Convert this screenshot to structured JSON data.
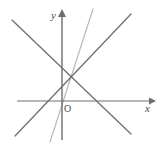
{
  "figure": {
    "background_color": "#ffffff",
    "width": 160,
    "height": 148
  },
  "axes": {
    "x_axis": {
      "name": "x-axis",
      "label": "x",
      "label_x": 145,
      "label_y": 112,
      "color": "#6e6e6e",
      "stroke_width": 1.2,
      "x1": 17,
      "y1": 101,
      "x2": 150,
      "y2": 101,
      "arrow": "right"
    },
    "y_axis": {
      "name": "y-axis",
      "label": "y",
      "label_x": 51,
      "label_y": 19,
      "color": "#6e6e6e",
      "stroke_width": 1.4,
      "x1": 62,
      "y1": 140,
      "x2": 62,
      "y2": 16,
      "arrow": "up"
    },
    "origin": {
      "label": "O",
      "label_x": 64,
      "label_y": 112,
      "point_x": 62,
      "point_y": 101
    }
  },
  "lines": [
    {
      "name": "descending-line",
      "description": "line falling from upper-left to lower-right",
      "color": "#6f6f6f",
      "stroke_width": 1.3,
      "x1": 12,
      "y1": 20,
      "x2": 131,
      "y2": 134,
      "x_intercept_px": 86,
      "y_intercept_px": 70
    },
    {
      "name": "ascending-line",
      "description": "line rising from lower-left to upper-right",
      "color": "#6f6f6f",
      "stroke_width": 1.3,
      "x1": 15,
      "y1": 136,
      "x2": 131,
      "y2": 14,
      "x_intercept_px": 39,
      "y_intercept_px": 60
    },
    {
      "name": "steep-line",
      "description": "steep light line from top-right to bottom-left",
      "color": "#b9b9b9",
      "stroke_width": 1.2,
      "x1": 93,
      "y1": 9,
      "x2": 50,
      "y2": 142,
      "x_intercept_px": 57,
      "y_intercept_px": 87
    }
  ],
  "intersection": {
    "name": "common-intersection-point",
    "x": 66,
    "y": 76,
    "visible_marker": false
  },
  "chart_data": {
    "type": "line",
    "title": "",
    "xlabel": "x",
    "ylabel": "y",
    "grid": false,
    "legend": "none",
    "note": "Three straight lines drawn on a pair of coordinate axes; all three pass through a single common point located above and left of the origin in the second quadrant region near the y-axis.",
    "series": [
      {
        "name": "descending-line",
        "x": [
          -1.67,
          2.3
        ],
        "y": [
          2.7,
          -1.1
        ]
      },
      {
        "name": "ascending-line",
        "x": [
          -1.57,
          2.3
        ],
        "y": [
          -1.17,
          2.9
        ]
      },
      {
        "name": "steep-line",
        "x": [
          1.03,
          -0.4
        ],
        "y": [
          3.07,
          -1.37
        ]
      }
    ],
    "common_point": {
      "x": 0.13,
      "y": 0.83
    },
    "xlim": [
      -1.8,
      3.1
    ],
    "ylim": [
      -1.5,
      3.1
    ]
  }
}
